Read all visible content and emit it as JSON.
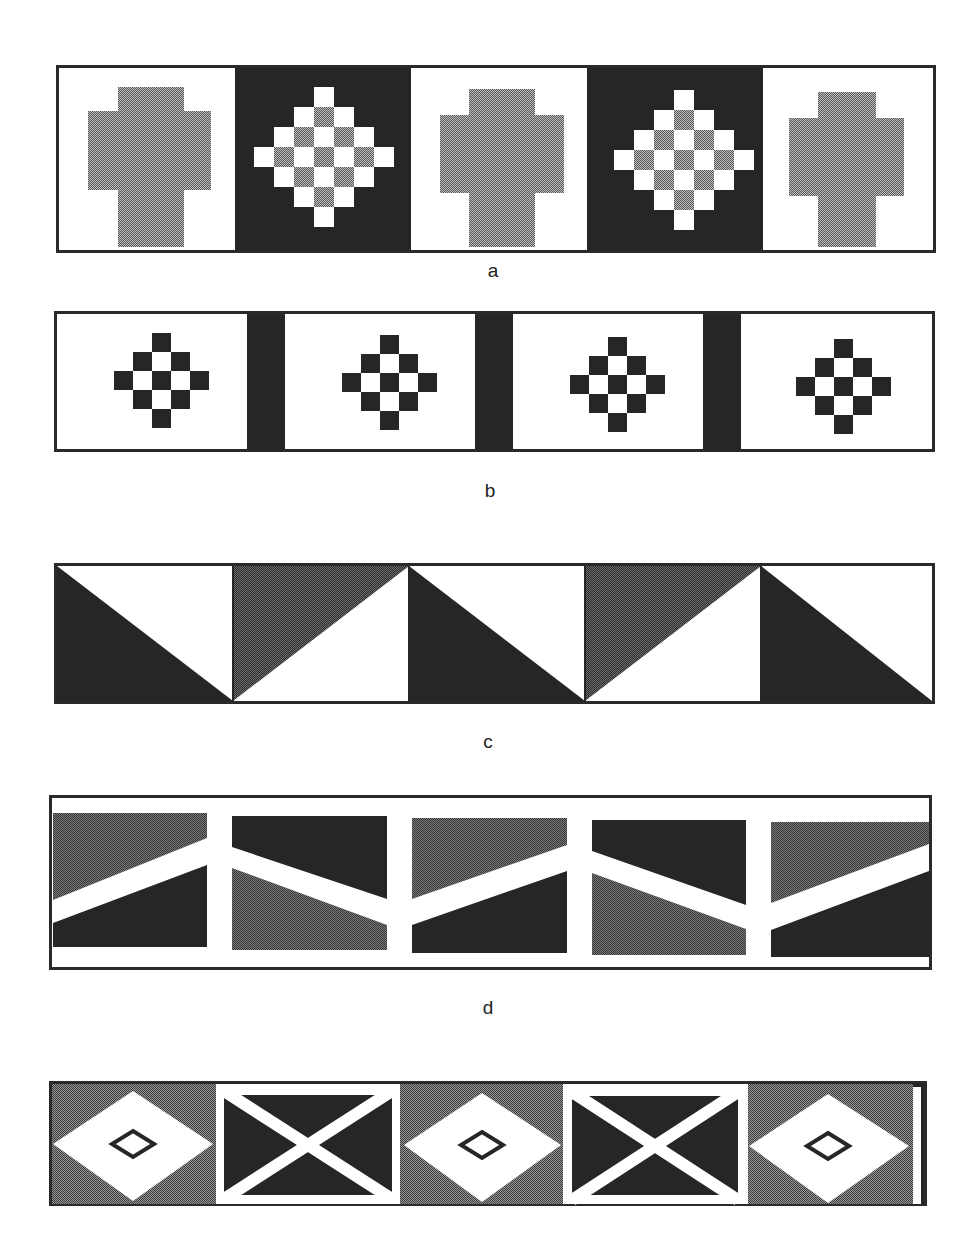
{
  "figure": {
    "colors": {
      "black": "#262626",
      "grey": "#8f8f8f",
      "dark_grey": "#4a4a4a",
      "white": "#ffffff",
      "border": "#2a2a2a"
    },
    "panels": [
      {
        "id": "a",
        "label": "a",
        "description": "Alternating white tiles with grey stepped cross and black tiles with grey/white checkered diamond",
        "tile_count": 5
      },
      {
        "id": "b",
        "label": "b",
        "description": "White tiles with small black/white checkered diamond separated by black bars",
        "tile_count": 4
      },
      {
        "id": "c",
        "label": "c",
        "description": "Alternating diagonally split squares of black/white and grey/white triangles",
        "tile_count": 5
      },
      {
        "id": "d",
        "label": "d",
        "description": "Grey and black trapezoid blocks with white zigzag band and white borders",
        "tile_count": 5
      },
      {
        "id": "e",
        "label": "",
        "description": "Grey tiles with white diamond containing small outlined diamond alternating with black tiles with white X",
        "tile_count": 5
      }
    ]
  }
}
